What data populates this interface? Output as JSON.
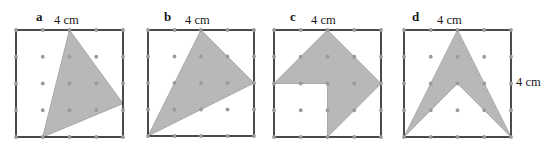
{
  "figure": {
    "width": 546,
    "height": 150,
    "background": "#ffffff",
    "grid": {
      "divisions": 4,
      "dot_color": "#9a9a9a",
      "dot_radius": 1.9
    },
    "style": {
      "square_stroke": "#1d1d1d",
      "square_stroke_width": 1.6,
      "shade_fill": "#b8b8b8",
      "shade_stroke": "#a8a8a8",
      "text_color": "#1a1a1a"
    }
  },
  "panels": [
    {
      "letter": "a",
      "letter_x": 36,
      "letter_y": 10,
      "top_label": "4 cm",
      "top_label_x": 54,
      "top_label_y": 14,
      "square": {
        "x": 16,
        "y": 30,
        "size": 107
      },
      "shape_name": "slanted-triangle",
      "polygon": [
        [
          2,
          0
        ],
        [
          4,
          2.75
        ],
        [
          1,
          4
        ]
      ]
    },
    {
      "letter": "b",
      "letter_x": 164,
      "letter_y": 10,
      "top_label": "4 cm",
      "top_label_x": 185,
      "top_label_y": 14,
      "square": {
        "x": 148,
        "y": 30,
        "size": 106
      },
      "shape_name": "wide-triangle",
      "polygon": [
        [
          2,
          0
        ],
        [
          4,
          2
        ],
        [
          0,
          4
        ]
      ]
    },
    {
      "letter": "c",
      "letter_x": 290,
      "letter_y": 10,
      "top_label": "4 cm",
      "top_label_x": 311,
      "top_label_y": 14,
      "square": {
        "x": 274,
        "y": 30,
        "size": 107
      },
      "shape_name": "notched-diamond",
      "polygon": [
        [
          2,
          0
        ],
        [
          4,
          2
        ],
        [
          2,
          4
        ],
        [
          2,
          2
        ],
        [
          0,
          2
        ]
      ]
    },
    {
      "letter": "d",
      "letter_x": 412,
      "letter_y": 10,
      "top_label": "4 cm",
      "top_label_x": 437,
      "top_label_y": 14,
      "square": {
        "x": 404,
        "y": 30,
        "size": 107
      },
      "shape_name": "arrowhead-chevron",
      "side_label": "4 cm",
      "side_label_x": 516,
      "side_label_y": 76,
      "polygon": [
        [
          2,
          0
        ],
        [
          4,
          4
        ],
        [
          2,
          2
        ],
        [
          0,
          4
        ]
      ]
    }
  ]
}
